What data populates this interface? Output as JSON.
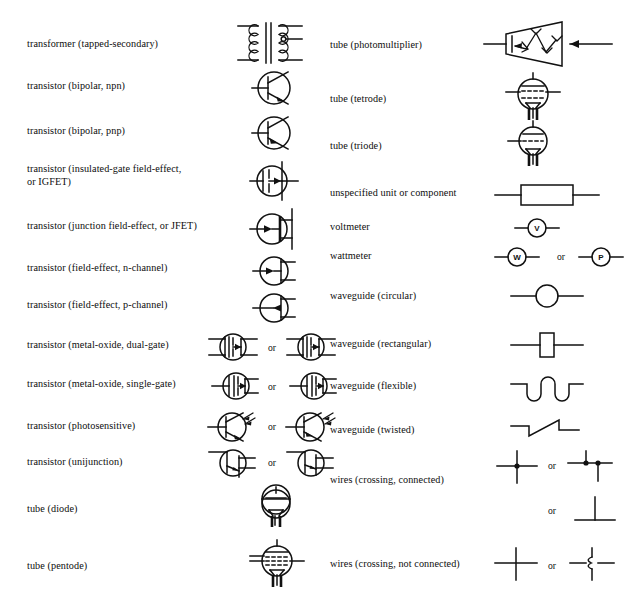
{
  "page": {
    "background_color": "#ffffff",
    "ink_color": "#111111",
    "or_label": "or"
  },
  "left_column": {
    "entries": [
      {
        "label": "transformer (tapped-secondary)",
        "symbol": "transformer-tapped-secondary",
        "variants": 1
      },
      {
        "label": "transistor (bipolar, npn)",
        "symbol": "transistor-bipolar-npn",
        "variants": 1
      },
      {
        "label": "transistor (bipolar, pnp)",
        "symbol": "transistor-bipolar-pnp",
        "variants": 1
      },
      {
        "label": "transistor (insulated-gate field-effect,\nor IGFET)",
        "symbol": "transistor-igfet",
        "variants": 1
      },
      {
        "label": "transistor (junction field-effect, or JFET)",
        "symbol": "transistor-jfet",
        "variants": 1
      },
      {
        "label": "transistor (field-effect, n-channel)",
        "symbol": "transistor-fet-n-channel",
        "variants": 1
      },
      {
        "label": "transistor (field-effect, p-channel)",
        "symbol": "transistor-fet-p-channel",
        "variants": 1
      },
      {
        "label": "transistor (metal-oxide, dual-gate)",
        "symbol": "transistor-mosfet-dual-gate",
        "variants": 2
      },
      {
        "label": "transistor (metal-oxide, single-gate)",
        "symbol": "transistor-mosfet-single-gate",
        "variants": 2
      },
      {
        "label": "transistor (photosensitive)",
        "symbol": "transistor-photosensitive",
        "variants": 2
      },
      {
        "label": "transistor (unijunction)",
        "symbol": "transistor-unijunction",
        "variants": 2
      },
      {
        "label": "tube (diode)",
        "symbol": "tube-diode",
        "variants": 1
      },
      {
        "label": "tube (pentode)",
        "symbol": "tube-pentode",
        "variants": 1
      }
    ]
  },
  "right_column": {
    "entries": [
      {
        "label": "tube (photomultiplier)",
        "symbol": "tube-photomultiplier",
        "variants": 1
      },
      {
        "label": "tube (tetrode)",
        "symbol": "tube-tetrode",
        "variants": 1
      },
      {
        "label": "tube (triode)",
        "symbol": "tube-triode",
        "variants": 1
      },
      {
        "label": "unspecified unit or component",
        "symbol": "unspecified-unit",
        "variants": 1
      },
      {
        "label": "voltmeter",
        "symbol": "voltmeter",
        "variants": 1,
        "glyphs": [
          "V"
        ]
      },
      {
        "label": "wattmeter",
        "symbol": "wattmeter",
        "variants": 2,
        "glyphs": [
          "W",
          "P"
        ]
      },
      {
        "label": "waveguide (circular)",
        "symbol": "waveguide-circular",
        "variants": 1
      },
      {
        "label": "waveguide (rectangular)",
        "symbol": "waveguide-rectangular",
        "variants": 1
      },
      {
        "label": "waveguide (flexible)",
        "symbol": "waveguide-flexible",
        "variants": 1
      },
      {
        "label": "waveguide (twisted)",
        "symbol": "waveguide-twisted",
        "variants": 1
      },
      {
        "label": "wires (crossing, connected)",
        "symbol": "wires-crossing-connected",
        "variants": 3
      },
      {
        "label": "wires (crossing, not connected)",
        "symbol": "wires-crossing-not-connected",
        "variants": 2
      }
    ]
  }
}
